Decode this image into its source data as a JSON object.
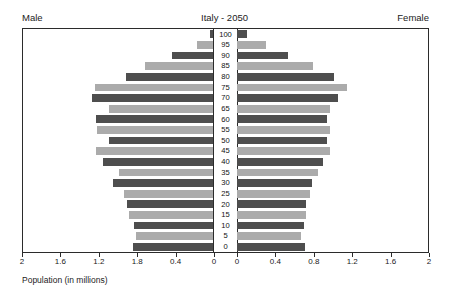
{
  "header": {
    "left_label": "Male",
    "title": "Italy - 2050",
    "right_label": "Female"
  },
  "axis_caption": "Population (in millions)",
  "colors": {
    "dark_bar": "#4e4e4e",
    "light_bar": "#ababab",
    "frame": "#2b2b2b",
    "background": "#ffffff"
  },
  "chart_data": {
    "type": "bar",
    "subtype": "population-pyramid",
    "title": "Italy - 2050",
    "xlabel": "Population (in millions)",
    "ylabel": "",
    "orientation": "horizontal",
    "grid": false,
    "legend_position": "none",
    "left_side_label": "Male",
    "right_side_label": "Female",
    "left_axis_direction": "reversed",
    "left_xlim": [
      2,
      0
    ],
    "right_xlim": [
      0,
      2
    ],
    "left_ticks": [
      "2",
      "1.6",
      "1.2",
      "1.8",
      "0.4",
      "0"
    ],
    "left_tick_values": [
      2,
      1.6,
      1.2,
      0.8,
      0.4,
      0
    ],
    "right_ticks": [
      "0",
      "0.4",
      "0.8",
      "1.2",
      "1.6",
      "2"
    ],
    "right_tick_values": [
      0,
      0.4,
      0.8,
      1.2,
      1.6,
      2
    ],
    "categories": [
      "100",
      "95",
      "90",
      "85",
      "80",
      "75",
      "70",
      "65",
      "60",
      "55",
      "50",
      "45",
      "40",
      "35",
      "30",
      "25",
      "20",
      "15",
      "10",
      "5",
      "0"
    ],
    "series": [
      {
        "name": "Male",
        "side": "left",
        "values": [
          0.04,
          0.18,
          0.44,
          0.72,
          0.92,
          1.25,
          1.28,
          1.1,
          1.24,
          1.23,
          1.1,
          1.24,
          1.16,
          1.0,
          1.06,
          0.94,
          0.91,
          0.89,
          0.84,
          0.82,
          0.85
        ]
      },
      {
        "name": "Female",
        "side": "right",
        "values": [
          0.1,
          0.3,
          0.53,
          0.8,
          1.02,
          1.15,
          1.06,
          0.97,
          0.94,
          0.97,
          0.94,
          0.97,
          0.9,
          0.85,
          0.79,
          0.76,
          0.72,
          0.72,
          0.7,
          0.67,
          0.71
        ]
      }
    ],
    "bar_shades": [
      "dark",
      "light",
      "dark",
      "light",
      "dark",
      "light",
      "dark",
      "light",
      "dark",
      "light",
      "dark",
      "light",
      "dark",
      "light",
      "dark",
      "light",
      "dark",
      "light",
      "dark",
      "light",
      "dark"
    ]
  }
}
